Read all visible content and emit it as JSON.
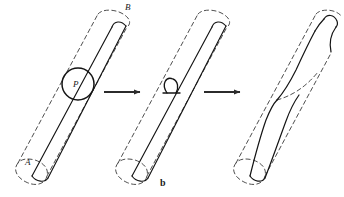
{
  "figure": {
    "caption": "b",
    "colors": {
      "ink": "#1a1a1a",
      "dash": "#3a3a3a",
      "background": "#ffffff"
    },
    "labels": {
      "point_B": "B",
      "point_A": "A",
      "point_P": "P"
    },
    "panels": [
      {
        "index": 1,
        "name": "initial-cylinder-with-dislocation-loop",
        "description": "Dashed outline cylinder inclined to the right with solid slip line from A to B and a solid circle labelled P marking the dislocation loop"
      },
      {
        "index": 2,
        "name": "cylinder-with-contracted-loop",
        "description": "Same cylinder after the loop P has contracted into a small hook on the left surface"
      },
      {
        "index": 3,
        "name": "sheared-cylinder",
        "description": "Cylinder after slip, showing an S-shaped trace and the displaced upper portion offset from the dashed original outline"
      }
    ],
    "arrows": [
      {
        "name": "arrow-1",
        "from_panel": 1,
        "to_panel": 2
      },
      {
        "name": "arrow-2",
        "from_panel": 2,
        "to_panel": 3
      }
    ]
  }
}
